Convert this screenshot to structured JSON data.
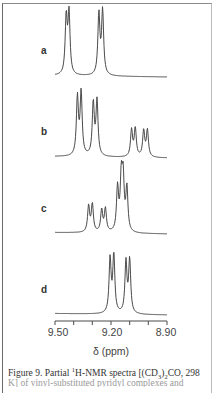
{
  "chart_data": {
    "type": "line",
    "title": "",
    "xlabel": "δ (ppm)",
    "ylabel": "",
    "xlim": [
      9.5,
      8.9
    ],
    "x_reversed": true,
    "x_ticks": [
      9.5,
      9.45,
      9.4,
      9.35,
      9.3,
      9.25,
      9.2,
      9.15,
      9.1,
      9.05,
      9.0,
      8.95,
      8.9
    ],
    "x_tick_labels": [
      "9.50",
      "9.20",
      "8.90"
    ],
    "grid": false,
    "legend": "none",
    "series": [
      {
        "name": "a",
        "description": "two doublets",
        "peaks_ppm": [
          9.44,
          9.425,
          9.265,
          9.245
        ],
        "relative_heights": [
          0.98,
          1.04,
          1.04,
          1.1
        ]
      },
      {
        "name": "b",
        "description": "two doublets plus two smaller doublets upfield",
        "peaks_ppm": [
          9.38,
          9.36,
          9.295,
          9.275,
          9.09,
          9.07,
          9.025,
          9.005
        ],
        "relative_heights": [
          1.0,
          1.08,
          0.91,
          0.94,
          0.46,
          0.49,
          0.45,
          0.46
        ]
      },
      {
        "name": "c",
        "description": "two doublets plus overlapping multiplet",
        "peaks_ppm": [
          9.32,
          9.3,
          9.25,
          9.23,
          9.165,
          9.145,
          9.135,
          9.115
        ],
        "relative_heights": [
          0.45,
          0.48,
          0.38,
          0.4,
          0.75,
          0.88,
          0.86,
          0.75
        ]
      },
      {
        "name": "d",
        "description": "two doublets",
        "peaks_ppm": [
          9.205,
          9.185,
          9.12,
          9.1
        ],
        "relative_heights": [
          0.93,
          1.0,
          0.88,
          0.92
        ]
      }
    ]
  },
  "labels": {
    "a": "a",
    "b": "b",
    "c": "c",
    "d": "d"
  },
  "axis": {
    "tick_labels": [
      "9.50",
      "9.20",
      "8.90"
    ],
    "xlabel": "δ (ppm)"
  },
  "caption": {
    "prefix": "Figure 9.  Partial ",
    "sup1": "1",
    "middle": "H-NMR spectra [(CD",
    "sub1": "3",
    "mid2": ")",
    "sub2": "2",
    "suffix": "CO, 298",
    "line2": "K] of vinyl-substituted pyridyl complexes and"
  }
}
